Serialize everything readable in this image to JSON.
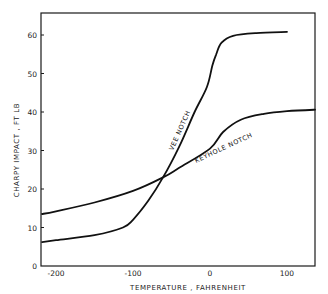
{
  "chart_data": {
    "type": "line",
    "title": "",
    "xlabel": "TEMPERATURE , FAHRENHEIT",
    "ylabel": "CHARPY IMPACT , FT LB",
    "xlim": [
      -218,
      138
    ],
    "ylim": [
      0,
      66
    ],
    "xticks": [
      -200,
      -100,
      0,
      100
    ],
    "xtick_labels": [
      "-200",
      "-100",
      "0",
      "100"
    ],
    "yticks": [
      0,
      10,
      20,
      30,
      40,
      50,
      60
    ],
    "ytick_labels": [
      "0",
      "10",
      "20",
      "30",
      "40",
      "50",
      "60"
    ],
    "grid": false,
    "legend": "inline curve labels",
    "series": [
      {
        "name": "VEE NOTCH",
        "label": "VEE NOTCH",
        "x": [
          -218,
          -200,
          -150,
          -113,
          -100,
          -80,
          -61,
          -40,
          -20,
          -4,
          3,
          8,
          15,
          30,
          60,
          100
        ],
        "y": [
          6.2,
          6.7,
          8,
          10,
          12,
          17,
          23,
          31,
          40,
          46.5,
          52,
          55,
          58,
          59.8,
          60.5,
          60.8
        ]
      },
      {
        "name": "KEYHOLE NOTCH",
        "label": "KEYHOLE NOTCH",
        "x": [
          -218,
          -200,
          -150,
          -100,
          -61,
          -40,
          0,
          17,
          40,
          70,
          100,
          138
        ],
        "y": [
          13.5,
          14.2,
          16.5,
          19.5,
          23,
          25.5,
          30.5,
          34.8,
          38,
          39.5,
          40.2,
          40.6
        ]
      }
    ],
    "annotations": [
      "VEE NOTCH",
      "KEYHOLE NOTCH"
    ]
  }
}
